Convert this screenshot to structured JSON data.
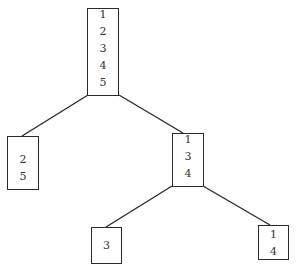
{
  "diagram": {
    "type": "tree",
    "colors": {
      "line": "#2a2a2a",
      "text": "#333333",
      "background": "#ffffff"
    },
    "nodes": [
      {
        "id": "root",
        "items": [
          "1",
          "2",
          "3",
          "4",
          "5"
        ]
      },
      {
        "id": "left",
        "items": [
          "2",
          "5"
        ]
      },
      {
        "id": "right",
        "items": [
          "1",
          "3",
          "4"
        ]
      },
      {
        "id": "right-left",
        "items": [
          "3"
        ]
      },
      {
        "id": "right-right",
        "items": [
          "1",
          "4"
        ]
      }
    ],
    "edges": [
      {
        "from": "root",
        "to": "left"
      },
      {
        "from": "root",
        "to": "right"
      },
      {
        "from": "right",
        "to": "right-left"
      },
      {
        "from": "right",
        "to": "right-right"
      }
    ]
  }
}
